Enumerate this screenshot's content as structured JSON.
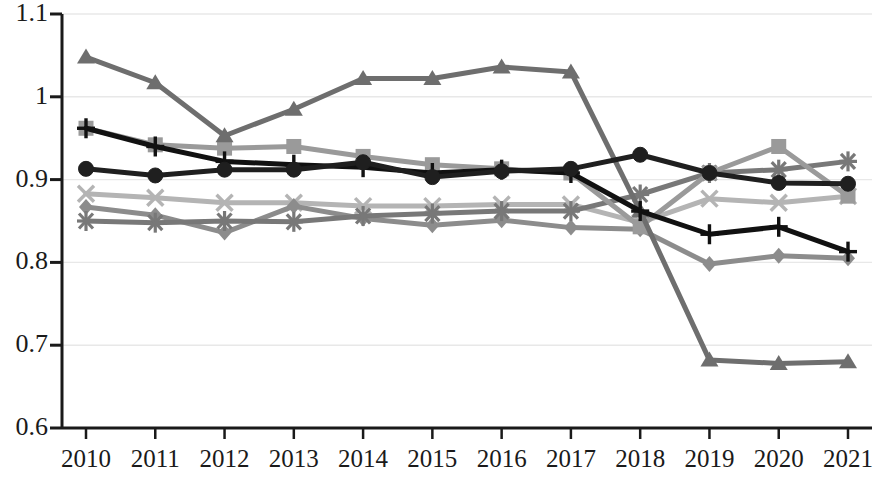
{
  "chart_data": {
    "type": "line",
    "title": "",
    "subtitle": "",
    "xlabel": "",
    "ylabel": "",
    "x": [
      2010,
      2011,
      2012,
      2013,
      2014,
      2015,
      2016,
      2017,
      2018,
      2019,
      2020,
      2021
    ],
    "categories": [
      "2010",
      "2011",
      "2012",
      "2013",
      "2014",
      "2015",
      "2016",
      "2017",
      "2018",
      "2019",
      "2020",
      "2021"
    ],
    "xlim": [
      2010,
      2021
    ],
    "ylim": [
      0.6,
      1.1
    ],
    "y_ticks": [
      "1.1",
      "1",
      "0.9",
      "0.8",
      "0.7",
      "0.6"
    ],
    "y_tick_values": [
      1.1,
      1.0,
      0.9,
      0.8,
      0.7,
      0.6
    ],
    "grid": "horizontal",
    "legend": "none",
    "background_color": "#ffffff",
    "gridline_color": "#e8e8e8",
    "axis_color": "#1a1a1a",
    "series": [
      {
        "name": "Series 1",
        "marker": "triangle",
        "color": "#6e6e6e",
        "values": [
          1.048,
          1.017,
          0.953,
          0.985,
          1.022,
          1.022,
          1.036,
          1.03,
          0.862,
          0.682,
          0.678,
          0.68
        ]
      },
      {
        "name": "Series 2",
        "marker": "square",
        "color": "#9a9a9a",
        "values": [
          0.962,
          0.942,
          0.938,
          0.94,
          0.928,
          0.918,
          0.913,
          0.908,
          0.843,
          0.908,
          0.94,
          0.88
        ]
      },
      {
        "name": "Series 3",
        "marker": "plus",
        "color": "#111111",
        "values": [
          0.962,
          0.94,
          0.922,
          0.918,
          0.915,
          0.908,
          0.912,
          0.908,
          0.862,
          0.834,
          0.843,
          0.813
        ]
      },
      {
        "name": "Series 4",
        "marker": "circle",
        "color": "#1f1f1f",
        "values": [
          0.913,
          0.905,
          0.912,
          0.912,
          0.921,
          0.903,
          0.91,
          0.913,
          0.93,
          0.908,
          0.896,
          0.895
        ]
      },
      {
        "name": "Series 5",
        "marker": "cross-x",
        "color": "#b4b4b4",
        "values": [
          0.883,
          0.878,
          0.872,
          0.872,
          0.868,
          0.868,
          0.87,
          0.87,
          0.848,
          0.877,
          0.872,
          0.88
        ]
      },
      {
        "name": "Series 6",
        "marker": "asterisk",
        "color": "#787878",
        "values": [
          0.85,
          0.848,
          0.85,
          0.849,
          0.856,
          0.859,
          0.862,
          0.862,
          0.882,
          0.908,
          0.912,
          0.922
        ]
      },
      {
        "name": "Series 7",
        "marker": "diamond",
        "color": "#8c8c8c",
        "values": [
          0.867,
          0.857,
          0.836,
          0.868,
          0.853,
          0.845,
          0.851,
          0.842,
          0.84,
          0.798,
          0.808,
          0.805
        ]
      }
    ]
  },
  "axes": {
    "y_labels": [
      "1.1",
      "1",
      "0.9",
      "0.8",
      "0.7",
      "0.6"
    ],
    "x_labels": [
      "2010",
      "2011",
      "2012",
      "2013",
      "2014",
      "2015",
      "2016",
      "2017",
      "2018",
      "2019",
      "2020",
      "2021"
    ]
  }
}
